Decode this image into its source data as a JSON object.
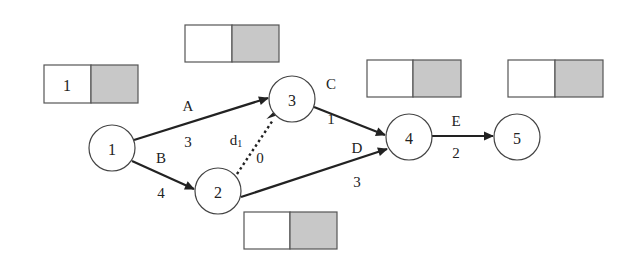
{
  "diagram": {
    "type": "activity-on-arrow network",
    "nodes": [
      {
        "id": "1",
        "label": "1",
        "cx": 112,
        "cy": 148
      },
      {
        "id": "2",
        "label": "2",
        "cx": 218,
        "cy": 191
      },
      {
        "id": "3",
        "label": "3",
        "cx": 292,
        "cy": 99
      },
      {
        "id": "4",
        "label": "4",
        "cx": 409,
        "cy": 137
      },
      {
        "id": "5",
        "label": "5",
        "cx": 517,
        "cy": 137
      }
    ],
    "edges": [
      {
        "id": "A",
        "from": "1",
        "to": "3",
        "name": "A",
        "duration": "3",
        "style": "solid"
      },
      {
        "id": "B",
        "from": "1",
        "to": "2",
        "name": "B",
        "duration": "4",
        "style": "solid"
      },
      {
        "id": "d1",
        "from": "2",
        "to": "3",
        "name": "d",
        "name_sub": "1",
        "duration": "0",
        "style": "dotted"
      },
      {
        "id": "C",
        "from": "3",
        "to": "4",
        "name": "C",
        "duration": "1",
        "style": "solid"
      },
      {
        "id": "D",
        "from": "2",
        "to": "4",
        "name": "D",
        "duration": "3",
        "style": "solid"
      },
      {
        "id": "E",
        "from": "4",
        "to": "5",
        "name": "E",
        "duration": "2",
        "style": "solid"
      }
    ],
    "time_boxes": [
      {
        "node": "1",
        "left_value": "1",
        "right_value": ""
      },
      {
        "node": "2",
        "left_value": "",
        "right_value": ""
      },
      {
        "node": "3",
        "left_value": "",
        "right_value": ""
      },
      {
        "node": "4",
        "left_value": "",
        "right_value": ""
      },
      {
        "node": "5",
        "left_value": "",
        "right_value": ""
      }
    ],
    "colors": {
      "line": "#222222",
      "box_shaded": "#c8c8c8",
      "box_border": "#555555"
    }
  }
}
